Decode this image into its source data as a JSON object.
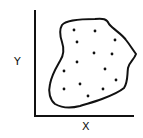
{
  "diagram": {
    "axes": {
      "x_label": "X",
      "y_label": "Y"
    },
    "region": {
      "description": "irregular closed blob containing scattered points"
    },
    "points": [
      [
        74,
        30
      ],
      [
        95,
        31
      ],
      [
        77,
        42
      ],
      [
        115,
        40
      ],
      [
        94,
        53
      ],
      [
        112,
        54
      ],
      [
        77,
        62
      ],
      [
        64,
        71
      ],
      [
        105,
        69
      ],
      [
        116,
        80
      ],
      [
        64,
        89
      ],
      [
        80,
        84
      ],
      [
        103,
        89
      ],
      [
        88,
        96
      ]
    ],
    "colors": {
      "ink": "#111111",
      "background": "#ffffff"
    }
  }
}
